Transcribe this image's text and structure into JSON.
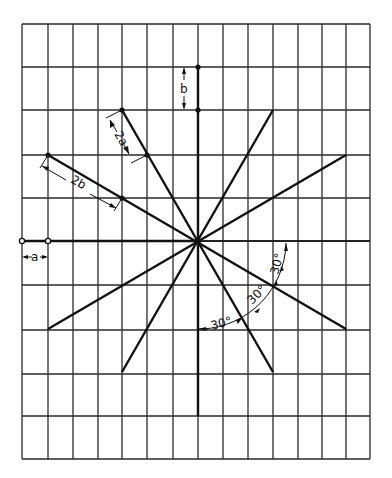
{
  "figure": {
    "grid": {
      "x_lines": [
        22,
        48,
        73,
        98,
        122,
        147,
        173,
        198,
        223,
        248,
        273,
        298,
        322,
        346,
        370
      ],
      "y_lines": [
        24,
        67,
        110,
        155,
        198,
        241,
        285,
        330,
        374,
        416,
        459
      ],
      "color": "#2a2a2a"
    },
    "center": {
      "x": 198,
      "y": 241
    },
    "rays": [
      {
        "name": "ray-steep-nw-se",
        "x1": 122,
        "y1": 110,
        "x2": 273,
        "y2": 372
      },
      {
        "name": "ray-shallow-nw-se",
        "x1": 48,
        "y1": 155,
        "x2": 346,
        "y2": 329
      },
      {
        "name": "ray-steep-ne-sw",
        "x1": 273,
        "y1": 110,
        "x2": 122,
        "y2": 372
      },
      {
        "name": "ray-shallow-ne-sw",
        "x1": 346,
        "y1": 155,
        "x2": 48,
        "y2": 329
      },
      {
        "name": "axis-vertical",
        "x1": 198,
        "y1": 67,
        "x2": 198,
        "y2": 416
      },
      {
        "name": "axis-horizontal",
        "x1": 22,
        "y1": 241,
        "x2": 198,
        "y2": 241
      }
    ],
    "labels": {
      "a": "a",
      "b": "b",
      "two_a": "2a",
      "two_b": "2b",
      "angle1": "30°",
      "angle2": "30°",
      "angle3": "30°"
    },
    "ink_color": "#111111"
  }
}
